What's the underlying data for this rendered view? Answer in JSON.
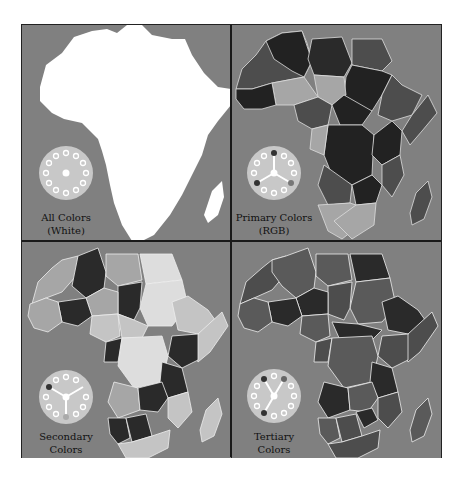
{
  "figure": {
    "panels": [
      {
        "id": "all-colors",
        "label_line1": "All Colors",
        "label_line2": "(White)",
        "wheel_markers": [],
        "center": "white"
      },
      {
        "id": "primary",
        "label_line1": "Primary Colors",
        "label_line2": "(RGB)",
        "wheel_markers": [
          "top",
          "lower-left",
          "lower-right"
        ]
      },
      {
        "id": "secondary",
        "label_line1": "Secondary",
        "label_line2": "Colors",
        "wheel_markers": [
          "upper-left",
          "upper-right",
          "bottom"
        ]
      },
      {
        "id": "tertiary",
        "label_line1": "Tertiary",
        "label_line2": "Colors",
        "wheel_markers": [
          "top-left",
          "top-right",
          "lower-left"
        ]
      }
    ],
    "colors": {
      "ocean": "#808080",
      "land_white": "#ffffff",
      "wheel_fill": "#c8c8c8",
      "border": "#1a1a1a",
      "dark": "#2a2a2a",
      "mid_dark": "#4d4d4d",
      "mid": "#666666",
      "light": "#a6a6a6",
      "lighter": "#c4c4c4"
    }
  }
}
